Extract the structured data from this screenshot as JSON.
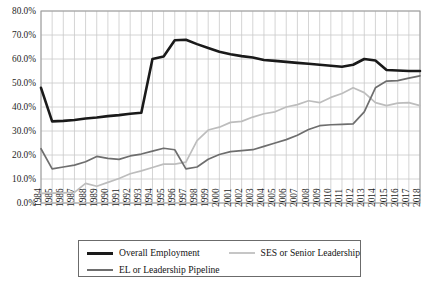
{
  "chart_data": {
    "type": "line",
    "title": "",
    "xlabel": "",
    "ylabel": "",
    "ylim": [
      0,
      0.8
    ],
    "ytick_labels": [
      "0.0%",
      "10.0%",
      "20.0%",
      "30.0%",
      "40.0%",
      "50.0%",
      "60.0%",
      "70.0%",
      "80.0%"
    ],
    "ytick_values": [
      0,
      10,
      20,
      30,
      40,
      50,
      60,
      70,
      80
    ],
    "grid": true,
    "legend_position": "bottom",
    "categories": [
      "1984",
      "1985",
      "1986",
      "1987",
      "1988",
      "1989",
      "1990",
      "1991",
      "1992",
      "1993",
      "1994",
      "1995",
      "1996",
      "1997",
      "1998",
      "1999",
      "2000",
      "2001",
      "2002",
      "2003",
      "2004",
      "2005",
      "2006",
      "2007",
      "2008",
      "2009",
      "2010",
      "2011",
      "2012",
      "2013",
      "2014",
      "2015",
      "2016",
      "2017",
      "2018"
    ],
    "series": [
      {
        "name": "Overall Employment",
        "color": "#1a1a1a",
        "width": 2.6,
        "values": [
          48.0,
          34.0,
          34.2,
          34.6,
          35.2,
          35.6,
          36.2,
          36.6,
          37.2,
          37.6,
          60.0,
          61.0,
          67.8,
          68.0,
          66.2,
          64.6,
          63.0,
          62.0,
          61.2,
          60.6,
          59.6,
          59.2,
          58.8,
          58.4,
          58.0,
          57.6,
          57.2,
          56.8,
          57.6,
          60.0,
          59.4,
          55.4,
          55.2,
          55.0,
          55.0
        ]
      },
      {
        "name": "EL or Leadership Pipeline",
        "color": "#6e6e6e",
        "width": 1.7,
        "values": [
          22.6,
          14.2,
          15.0,
          15.8,
          17.2,
          19.4,
          18.6,
          18.2,
          19.6,
          20.4,
          21.6,
          22.8,
          22.2,
          14.2,
          15.0,
          18.2,
          20.2,
          21.4,
          21.8,
          22.2,
          23.6,
          25.0,
          26.4,
          28.2,
          30.6,
          32.2,
          32.6,
          32.8,
          33.0,
          38.0,
          48.0,
          50.8,
          51.0,
          52.0,
          53.0
        ]
      },
      {
        "name": "SES or Senior Leadership",
        "color": "#bdbdbd",
        "width": 1.7,
        "values": [
          4.0,
          4.1,
          4.2,
          4.4,
          8.2,
          7.0,
          8.6,
          10.2,
          12.2,
          13.4,
          14.8,
          16.2,
          16.2,
          17.0,
          26.0,
          30.4,
          31.6,
          33.6,
          34.0,
          35.8,
          37.2,
          38.0,
          40.0,
          41.0,
          42.6,
          41.8,
          44.0,
          45.6,
          48.0,
          46.0,
          41.8,
          40.6,
          41.6,
          41.8,
          40.6
        ]
      }
    ],
    "legend": [
      {
        "label": "Overall Employment",
        "color": "#1a1a1a",
        "width": 3.2
      },
      {
        "label": "SES or Senior Leadership",
        "color": "#c6c6c6",
        "width": 1.8
      },
      {
        "label": "EL or Leadership Pipeline",
        "color": "#6e6e6e",
        "width": 1.8
      }
    ]
  },
  "axes": {
    "plot_left": 41,
    "plot_right": 420,
    "plot_top": 11,
    "plot_bottom": 203,
    "grid_color": "#c9c9c9",
    "frame_color": "#9a9a9a"
  }
}
